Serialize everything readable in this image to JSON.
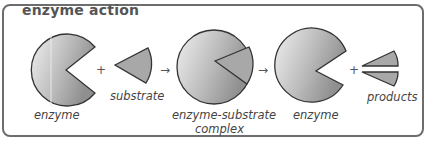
{
  "title": "enzyme action",
  "labels": {
    "enzyme_1": "enzyme",
    "substrate": "substrate",
    "complex_line1": "enzyme-substrate",
    "complex_line2": "complex",
    "enzyme_2": "enzyme",
    "products": "products"
  },
  "operators": {
    "plus_1": "+",
    "arrow_1": "→",
    "arrow_2": "→",
    "plus_2": "+"
  },
  "colors": {
    "border": "#6d6d6d",
    "shape_fill_light": "#e6e6e6",
    "shape_fill_dark": "#9a9a9a",
    "wedge_fill": "#a8a8a8",
    "outline": "#333333"
  }
}
